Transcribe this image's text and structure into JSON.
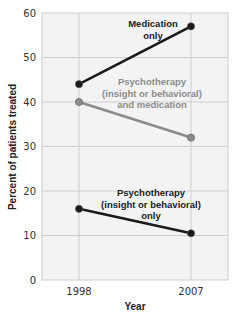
{
  "chart_data": {
    "type": "line",
    "title": "",
    "xlabel": "Year",
    "ylabel": "Percent of patients treated",
    "x": [
      "1998",
      "2007"
    ],
    "ylim": [
      0,
      60
    ],
    "yticks": [
      0,
      10,
      20,
      30,
      40,
      50,
      60
    ],
    "grid": true,
    "legend": "inline labels",
    "series": [
      {
        "name": "Medication only",
        "label_lines": [
          "Medication",
          "only"
        ],
        "values": [
          44,
          57
        ],
        "color": "#1a1a1a"
      },
      {
        "name": "Psychotherapy (insight or behavioral) and medication",
        "label_lines": [
          "Psychotherapy",
          "(insight or behavioral)",
          "and medication"
        ],
        "values": [
          40,
          32
        ],
        "color": "#8c8c8c"
      },
      {
        "name": "Psychotherapy (insight or behavioral) only",
        "label_lines": [
          "Psychotherapy",
          "(insight or behavioral)",
          "only"
        ],
        "values": [
          16,
          10.5
        ],
        "color": "#1a1a1a"
      }
    ]
  },
  "colors": {
    "plot_bg": "#f3f3f3",
    "grid": "#cfcfcf",
    "dark_series": "#1a1a1a",
    "gray_series": "#8c8c8c"
  }
}
